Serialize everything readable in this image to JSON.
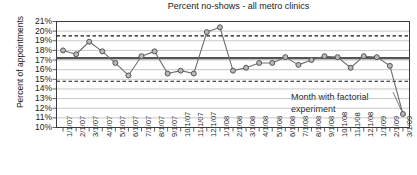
{
  "chart_data": {
    "type": "line",
    "title": "Percent no-shows - all metro clinics",
    "xlabel": "",
    "ylabel": "Percent of appointments",
    "ylim": [
      10,
      21
    ],
    "ytick_labels": [
      "21%",
      "20%",
      "19%",
      "18%",
      "17%",
      "16%",
      "15%",
      "14%",
      "13%",
      "12%",
      "11%",
      "10%"
    ],
    "ytick_values": [
      21,
      20,
      19,
      18,
      17,
      16,
      15,
      14,
      13,
      12,
      11,
      10
    ],
    "grid": true,
    "legend": "none",
    "categories": [
      "1/1/07",
      "2/1/07",
      "3/1/07",
      "4/1/07",
      "5/1/07",
      "6/1/07",
      "7/1/07",
      "8/1/07",
      "9/1/07",
      "10/1/07",
      "11/1/07",
      "12/1/07",
      "1/1/08",
      "2/1/08",
      "3/1/08",
      "4/1/08",
      "5/1/08",
      "6/1/08",
      "7/1/08",
      "8/1/08",
      "9/1/08",
      "10/1/08",
      "11/1/08",
      "12/1/08",
      "1/1/09",
      "2/1/09",
      "3/1/09"
    ],
    "series": [
      {
        "name": "Percent no-shows",
        "values": [
          18.0,
          17.6,
          18.9,
          17.9,
          16.7,
          15.4,
          17.4,
          17.9,
          15.6,
          15.9,
          15.6,
          19.9,
          20.4,
          15.9,
          16.2,
          16.7,
          16.7,
          17.3,
          16.5,
          17.0,
          17.4,
          17.3,
          16.2,
          17.4,
          17.3,
          16.4,
          11.4
        ]
      }
    ],
    "reference_lines": [
      {
        "name": "upper-control-limit",
        "value": 19.5,
        "style": "dashed",
        "color": "#1a1a1a"
      },
      {
        "name": "center-line",
        "value": 17.2,
        "style": "solid",
        "color": "#555555"
      },
      {
        "name": "lower-control-limit",
        "value": 14.8,
        "style": "dashed",
        "color": "#1a1a1a"
      }
    ],
    "annotations": [
      {
        "name": "factorial-experiment-note",
        "line1": "Month with factorial",
        "line2": "experiment",
        "points_to_category": "3/1/09"
      }
    ],
    "colors": {
      "line": "#6f6f6f",
      "marker_fill": "#b8b8b8",
      "marker_stroke": "#4a4a4a",
      "grid": "#b0b0b0",
      "axis": "#3a3a3a",
      "text": "#1a1a1a"
    }
  }
}
